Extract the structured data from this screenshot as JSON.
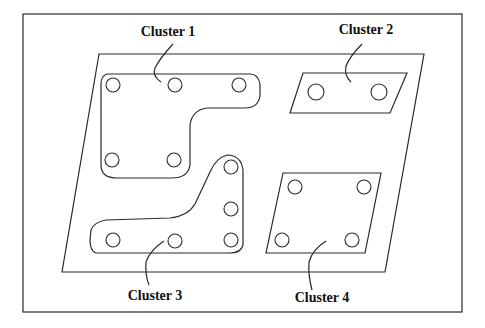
{
  "diagram": {
    "type": "board-cluster-layout",
    "labels": {
      "cluster1": "Cluster 1",
      "cluster2": "Cluster 2",
      "cluster3": "Cluster 3",
      "cluster4": "Cluster 4"
    },
    "clusters": [
      {
        "name": "Cluster 1",
        "hole_count": 5
      },
      {
        "name": "Cluster 2",
        "hole_count": 2
      },
      {
        "name": "Cluster 3",
        "hole_count": 6
      },
      {
        "name": "Cluster 4",
        "hole_count": 4
      }
    ],
    "colors": {
      "line": "#2a2a2a",
      "text": "#111111",
      "background": "#ffffff"
    }
  }
}
